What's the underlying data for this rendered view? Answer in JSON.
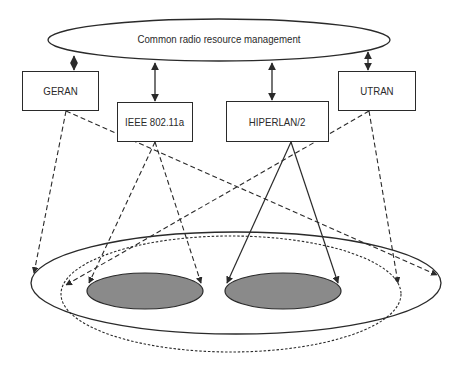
{
  "diagram": {
    "top_entity": {
      "label": "Common radio resource management"
    },
    "access_networks": [
      {
        "label": "GERAN"
      },
      {
        "label": "IEEE 802.11a"
      },
      {
        "label": "HIPERLAN/2"
      },
      {
        "label": "UTRAN"
      }
    ],
    "coverage_areas": [
      {
        "name": "large-cell-area-solid",
        "style": "solid"
      },
      {
        "name": "large-cell-area-dotted",
        "style": "dotted"
      },
      {
        "name": "hotspot-1",
        "style": "filled",
        "fill": "#8a8a8a"
      },
      {
        "name": "hotspot-2",
        "style": "filled",
        "fill": "#8a8a8a"
      }
    ],
    "colors": {
      "stroke": "#2a2a2a",
      "hotspot_fill": "#8a8a8a",
      "background": "#ffffff"
    }
  }
}
